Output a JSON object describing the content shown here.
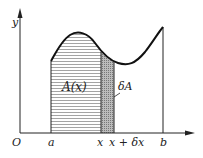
{
  "diagram": {
    "axes": {
      "x_label": "",
      "y_label": "y",
      "origin_label": "O"
    },
    "x_ticks": {
      "a": "a",
      "x": "x",
      "x_dx": "x + δx",
      "b": "b"
    },
    "regions": {
      "area": "A(x)",
      "strip": "δA"
    },
    "colors": {
      "line": "#222222",
      "hatch": "#555555",
      "strip": "#999999"
    }
  }
}
